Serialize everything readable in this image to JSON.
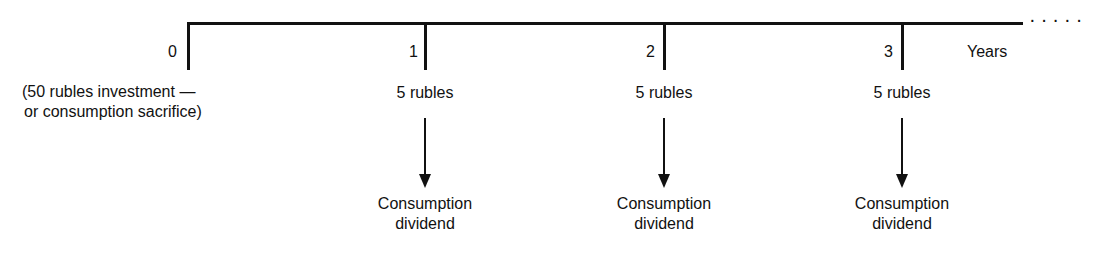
{
  "timeline": {
    "axis_label": "Years",
    "continuation": "·····",
    "periods": [
      {
        "year": "0",
        "amount": "(50 rubles investment —",
        "amount_line2": "or consumption sacrifice)"
      },
      {
        "year": "1",
        "amount": "5 rubles",
        "result_line1": "Consumption",
        "result_line2": "dividend"
      },
      {
        "year": "2",
        "amount": "5 rubles",
        "result_line1": "Consumption",
        "result_line2": "dividend"
      },
      {
        "year": "3",
        "amount": "5 rubles",
        "result_line1": "Consumption",
        "result_line2": "dividend"
      }
    ]
  }
}
